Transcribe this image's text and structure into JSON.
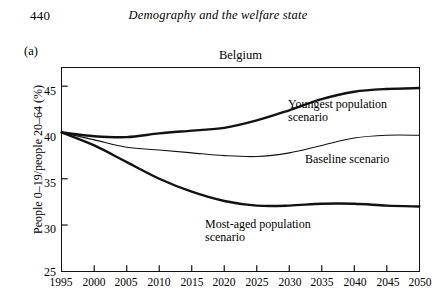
{
  "page": {
    "folio": "440",
    "running_title": "Demography and the welfare state"
  },
  "figure": {
    "panel_label": "(a)",
    "title": "Belgium",
    "ylabel": "People 0–19/people 20–64 (%)",
    "annotations": {
      "youngest": "Youngest population\nscenario",
      "baseline": "Baseline scenario",
      "most_aged": "Most-aged population\nscenario"
    }
  },
  "chart_data": {
    "type": "line",
    "title": "Belgium",
    "xlabel": "",
    "ylabel": "People 0–19/people 20–64 (%)",
    "xlim": [
      1995,
      2050
    ],
    "ylim": [
      25,
      47
    ],
    "yticks": [
      30,
      35,
      40,
      45
    ],
    "xticks": [
      1995,
      2000,
      2005,
      2010,
      2015,
      2020,
      2025,
      2030,
      2035,
      2040,
      2045,
      2050
    ],
    "grid": false,
    "legend": "annotated-inline",
    "x": [
      1995,
      2000,
      2005,
      2010,
      2015,
      2020,
      2025,
      2030,
      2035,
      2040,
      2045,
      2050
    ],
    "series": [
      {
        "name": "Youngest population scenario",
        "values": [
          40.0,
          39.6,
          39.5,
          39.9,
          40.2,
          40.5,
          41.3,
          42.4,
          43.6,
          44.4,
          44.7,
          44.8
        ],
        "line_width": "thick",
        "color": "#111111"
      },
      {
        "name": "Baseline scenario",
        "values": [
          40.0,
          39.2,
          38.4,
          38.1,
          37.8,
          37.5,
          37.4,
          37.8,
          38.6,
          39.4,
          39.7,
          39.7
        ],
        "line_width": "thin",
        "color": "#111111"
      },
      {
        "name": "Most-aged population scenario",
        "values": [
          40.0,
          38.6,
          36.8,
          35.0,
          33.6,
          32.6,
          32.1,
          32.1,
          32.3,
          32.3,
          32.1,
          32.0
        ],
        "line_width": "thick",
        "color": "#111111"
      }
    ]
  },
  "ytick_labels": [
    "45",
    "40",
    "35",
    "30",
    "25"
  ],
  "xtick_labels": [
    "1995",
    "2000",
    "2005",
    "2010",
    "2015",
    "2020",
    "2025",
    "2030",
    "2035",
    "2040",
    "2045",
    "2050"
  ]
}
